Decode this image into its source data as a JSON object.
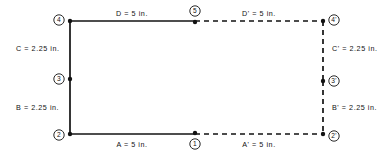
{
  "diagram": {
    "colors": {
      "ink": "#121212",
      "background": "#ffffff"
    },
    "nodes": [
      {
        "id": "node-4",
        "label": "4",
        "x": 70,
        "y": 21,
        "label_dx": -11,
        "label_dy": -1
      },
      {
        "id": "node-5",
        "label": "5",
        "x": 195,
        "y": 22,
        "label_dx": 0,
        "label_dy": -11
      },
      {
        "id": "node-4-prime",
        "label": "4'",
        "x": 323,
        "y": 21,
        "label_dx": 11,
        "label_dy": -1
      },
      {
        "id": "node-3",
        "label": "3",
        "x": 70,
        "y": 79,
        "label_dx": -11,
        "label_dy": 0
      },
      {
        "id": "node-3-prime",
        "label": "3'",
        "x": 323,
        "y": 81,
        "label_dx": 11,
        "label_dy": 0
      },
      {
        "id": "node-2",
        "label": "2",
        "x": 70,
        "y": 134,
        "label_dx": -11,
        "label_dy": 1
      },
      {
        "id": "node-1",
        "label": "1",
        "x": 195,
        "y": 133,
        "label_dx": 0,
        "label_dy": 11
      },
      {
        "id": "node-2-prime",
        "label": "2'",
        "x": 323,
        "y": 134,
        "label_dx": 11,
        "label_dy": 2
      }
    ],
    "edges": [
      {
        "id": "edge-D",
        "style": "solid",
        "x1": 70,
        "y1": 21,
        "x2": 195,
        "y2": 21
      },
      {
        "id": "edge-Dp",
        "style": "dashed",
        "x1": 195,
        "y1": 21,
        "x2": 323,
        "y2": 21
      },
      {
        "id": "edge-C",
        "style": "solid",
        "x1": 70,
        "y1": 21,
        "x2": 70,
        "y2": 79
      },
      {
        "id": "edge-B",
        "style": "solid",
        "x1": 70,
        "y1": 79,
        "x2": 70,
        "y2": 134
      },
      {
        "id": "edge-Cp",
        "style": "dashed",
        "x1": 323,
        "y1": 21,
        "x2": 323,
        "y2": 81
      },
      {
        "id": "edge-Bp",
        "style": "dashed",
        "x1": 323,
        "y1": 81,
        "x2": 323,
        "y2": 134
      },
      {
        "id": "edge-A",
        "style": "solid",
        "x1": 70,
        "y1": 134,
        "x2": 195,
        "y2": 134
      },
      {
        "id": "edge-Ap",
        "style": "dashed",
        "x1": 195,
        "y1": 134,
        "x2": 323,
        "y2": 134
      }
    ],
    "labels": [
      {
        "id": "label-D",
        "text": "D = 5 in.",
        "x": 132,
        "y": 16,
        "anchor": "middle"
      },
      {
        "id": "label-Dp",
        "text": "D' = 5 in.",
        "x": 259,
        "y": 16,
        "anchor": "middle"
      },
      {
        "id": "label-C",
        "text": "C = 2.25 in.",
        "x": 16,
        "y": 51,
        "anchor": "start"
      },
      {
        "id": "label-B",
        "text": "B = 2.25 in.",
        "x": 16,
        "y": 110,
        "anchor": "start"
      },
      {
        "id": "label-Cp",
        "text": "C' = 2.25 in.",
        "x": 332,
        "y": 51,
        "anchor": "start"
      },
      {
        "id": "label-Bp",
        "text": "B' = 2.25 in.",
        "x": 332,
        "y": 110,
        "anchor": "start"
      },
      {
        "id": "label-A",
        "text": "A = 5 in.",
        "x": 132,
        "y": 147,
        "anchor": "middle"
      },
      {
        "id": "label-Ap",
        "text": "A' = 5 in.",
        "x": 259,
        "y": 147,
        "anchor": "middle"
      }
    ]
  }
}
